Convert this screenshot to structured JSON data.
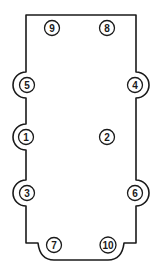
{
  "diagram": {
    "type": "bolt tightening sequence",
    "colors": {
      "line": "#1a1a1a",
      "background": "#ffffff"
    },
    "bolts": [
      {
        "label": "9",
        "x": 52,
        "y": 28
      },
      {
        "label": "8",
        "x": 107,
        "y": 28
      },
      {
        "label": "5",
        "x": 27,
        "y": 85
      },
      {
        "label": "4",
        "x": 135,
        "y": 85
      },
      {
        "label": "1",
        "x": 26,
        "y": 137
      },
      {
        "label": "2",
        "x": 107,
        "y": 137
      },
      {
        "label": "3",
        "x": 27,
        "y": 193
      },
      {
        "label": "6",
        "x": 135,
        "y": 193
      },
      {
        "label": "7",
        "x": 54,
        "y": 245
      },
      {
        "label": "10",
        "x": 108,
        "y": 245
      }
    ]
  }
}
